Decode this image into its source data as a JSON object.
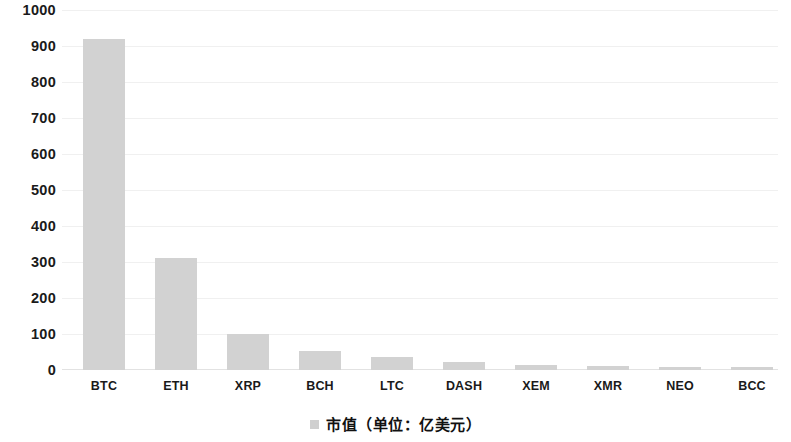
{
  "chart_data": {
    "type": "bar",
    "title": "",
    "subtitle": "",
    "xlabel": "",
    "ylabel": "",
    "categories": [
      "BTC",
      "ETH",
      "XRP",
      "BCH",
      "LTC",
      "DASH",
      "XEM",
      "XMR",
      "NEO",
      "BCC"
    ],
    "values": [
      920,
      310,
      100,
      52,
      35,
      22,
      15,
      10,
      8,
      7
    ],
    "series": [
      {
        "name": "市值（单位：亿美元）",
        "values": [
          920,
          310,
          100,
          52,
          35,
          22,
          15,
          10,
          8,
          7
        ]
      }
    ],
    "ylim": [
      0,
      1000
    ],
    "ytick_values": [
      1000,
      900,
      800,
      700,
      600,
      500,
      400,
      300,
      200,
      100,
      0
    ],
    "ytick_labels": [
      "1000",
      "900",
      "800",
      "700",
      "600",
      "500",
      "400",
      "300",
      "200",
      "100",
      "0"
    ],
    "ytick_step": 100,
    "grid": true,
    "grid_axis": "y",
    "grid_color": "#f0f0f0",
    "legend": {
      "position": "bottom-center",
      "entries": [
        {
          "label": "市值（单位：亿美元）",
          "marker": "legend-square-marker",
          "color": "#cfcfcf"
        }
      ]
    },
    "bar_color": "#d2d2d2",
    "background_color": "#ffffff",
    "text_color": "#1a1a1a"
  }
}
